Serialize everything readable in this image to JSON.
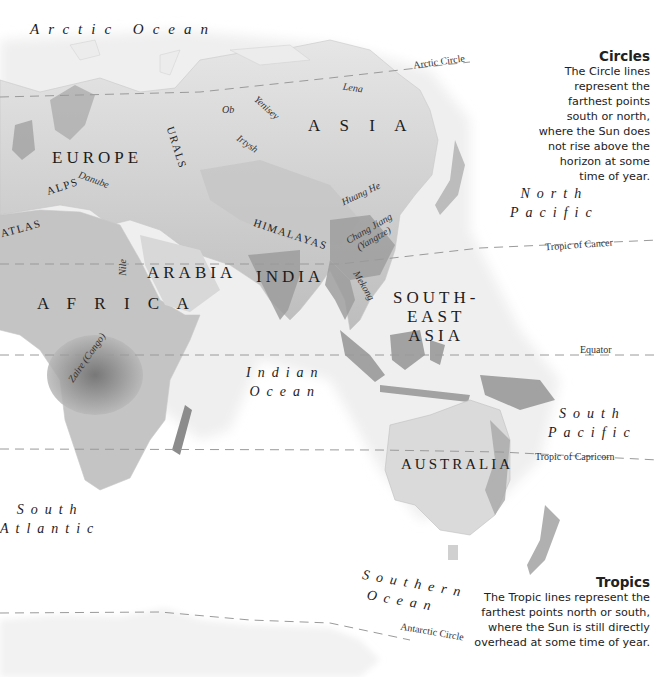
{
  "map": {
    "title": "World map: Eurasia, Africa, Australia",
    "colors": {
      "land_light": "#e2e2e2",
      "land_dark": "#8e8e8e",
      "ocean": "#ffffff",
      "line": "#9a9a9a",
      "text": "#1c1c1c"
    }
  },
  "regions": {
    "europe": "EUROPE",
    "asia": "A S I A",
    "arabia": "ARABIA",
    "india": "INDIA",
    "africa": "A F R I C A",
    "southeast_asia_1": "SOUTH-",
    "southeast_asia_2": "EAST",
    "southeast_asia_3": "ASIA",
    "australia": "AUSTRALIA"
  },
  "oceans": {
    "arctic": "Arctic Ocean",
    "north_pacific_1": "North",
    "north_pacific_2": "Pacific",
    "indian_1": "Indian",
    "indian_2": "Ocean",
    "south_pacific_1": "South",
    "south_pacific_2": "Pacific",
    "south_atlantic_1": "South",
    "south_atlantic_2": "Atlantic",
    "southern_1": "Southern",
    "southern_2": "Ocean"
  },
  "features": {
    "urals": "URALS",
    "alps": "ALPS",
    "atlas": "ATLAS",
    "himalayas": "HIMALAYAS",
    "danube": "Danube",
    "ob": "Ob",
    "yenisey": "Yenisey",
    "irtysh": "Irtysh",
    "lena": "Lena",
    "huang_he": "Huang He",
    "chang_jiang": "Chang Jiang",
    "yangtze": "(Yangtze)",
    "mekong": "Mekong",
    "nile": "Nile",
    "zaire": "Zaire (Congo)"
  },
  "lines": {
    "arctic_circle": "Arctic Circle",
    "tropic_cancer": "Tropic of Cancer",
    "equator": "Equator",
    "tropic_capricorn": "Tropic of Capricorn",
    "antarctic_circle": "Antarctic Circle"
  },
  "legend": {
    "circles": {
      "title": "Circles",
      "lines": [
        "The Circle lines",
        "represent the",
        "farthest points",
        "south or north,",
        "where the Sun does",
        "not rise above the",
        "horizon at some",
        "time of year."
      ]
    },
    "tropics": {
      "title": "Tropics",
      "lines": [
        "The Tropic lines represent the",
        "farthest points north or south,",
        "where the Sun is still directly",
        "overhead at some time of year."
      ]
    }
  }
}
